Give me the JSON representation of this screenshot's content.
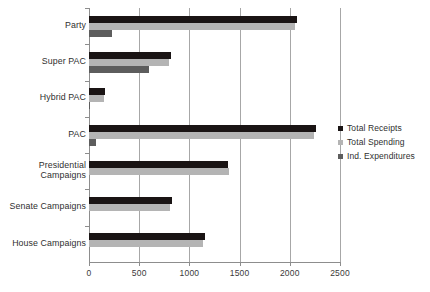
{
  "chart_data": {
    "type": "bar",
    "orientation": "horizontal",
    "title": "",
    "xlabel": "",
    "ylabel": "",
    "xlim": [
      0,
      2500
    ],
    "xticks": [
      0,
      500,
      1000,
      1500,
      2000,
      2500
    ],
    "xtick_labels": [
      "0",
      "500",
      "1000",
      "1500",
      "2000",
      "2500"
    ],
    "grid": true,
    "grid_axis": "x",
    "legend_position": "right",
    "categories": [
      "Party",
      "Super PAC",
      "Hybrid PAC",
      "PAC",
      "Presidential\nCampaigns",
      "Senate Campaigns",
      "House Campaigns"
    ],
    "series": [
      {
        "name": "Total Receipts",
        "color": "#1a1414",
        "values": [
          2070,
          820,
          160,
          2260,
          1385,
          825,
          1160
        ]
      },
      {
        "name": "Total Spending",
        "color": "#b4b4b4",
        "values": [
          2050,
          800,
          150,
          2240,
          1395,
          810,
          1140
        ]
      },
      {
        "name": "Ind. Expenditures",
        "color": "#5d5d5d",
        "values": [
          230,
          600,
          5,
          65,
          0,
          0,
          0
        ]
      }
    ]
  },
  "legend": {
    "items": [
      {
        "label": "Total Receipts"
      },
      {
        "label": "Total Spending"
      },
      {
        "label": "Ind. Expenditures"
      }
    ]
  }
}
